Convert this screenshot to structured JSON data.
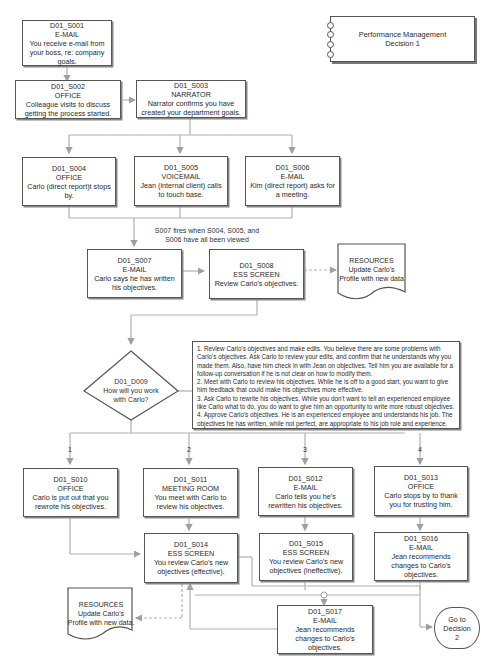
{
  "title_card": {
    "line1": "Performance Management",
    "line2": "Decision 1"
  },
  "nodes": {
    "s001": {
      "id": "D01_S001",
      "type": "E-MAIL",
      "text": "You receive e-mail from your boss, re: company goals."
    },
    "s002": {
      "id": "D01_S002",
      "type": "OFFICE",
      "text": "Colleague visits to discuss getting the process started."
    },
    "s003": {
      "id": "D01_S003",
      "type": "NARRATOR",
      "text": "Narrator confirms you have created your department goals."
    },
    "s004": {
      "id": "D01_S004",
      "type": "OFFICE",
      "text": "Carlo (direct report)t stops by."
    },
    "s005": {
      "id": "D01_S005",
      "type": "VOICEMAIL",
      "text": "Jean (internal client) calls to touch base."
    },
    "s006": {
      "id": "D01_S006",
      "type": "E-MAIL",
      "text": "Kim (direct report) asks for a meeting."
    },
    "s007": {
      "id": "D01_S007",
      "type": "E-MAIL",
      "text": "Carlo says he has written his objectives."
    },
    "s008": {
      "id": "D01_S008",
      "type": "ESS SCREEN",
      "text": "Review Carlo's objectives."
    },
    "s010": {
      "id": "D01_S010",
      "type": "OFFICE",
      "text": "Carlo is put out that you rewrote his objectives."
    },
    "s011": {
      "id": "D01_S011",
      "type": "MEETING ROOM",
      "text": "You meet with Carlo to review his objectives."
    },
    "s012": {
      "id": "D01_S012",
      "type": "E-MAIL",
      "text": "Carlo tells you he's rewritten his objectives."
    },
    "s013": {
      "id": "D01_S013",
      "type": "OFFICE",
      "text": "Carlo stops by to thank you for trusting him."
    },
    "s014": {
      "id": "D01_S014",
      "type": "ESS SCREEN",
      "text": "You review Carlo's new objectives (effective)."
    },
    "s015": {
      "id": "D01_S015",
      "type": "ESS SCREEN",
      "text": "You review Carlo's new objectives (ineffective)."
    },
    "s016": {
      "id": "D01_S016",
      "type": "E-MAIL",
      "text": "Jean recommends changes to Carlo's objectives."
    },
    "s017": {
      "id": "D01_S017",
      "type": "E-MAIL",
      "text": "Jean recommends changes to Carlo's objectives."
    }
  },
  "decision": {
    "id": "D01_D009",
    "question": "How will you work with Carlo?"
  },
  "fire_note": {
    "line1": "S007 fires when S004, S005, and",
    "line2": "S006 have all been viewed"
  },
  "resources_top": {
    "title": "RESOURCES",
    "line1": "Update Carlo's",
    "line2": "Profile with new data"
  },
  "resources_bottom": {
    "title": "RESOURCES",
    "line1": "Update Carlo's",
    "line2": "Profile with new data."
  },
  "options_note": "1. Review Carlo's objectives and make edits. You believe there are some problems with Carlo's objectives. Ask Carlo to review your edits, and confirm that he understands why you made them. Also, have him check in with Jean on objectives. Tell him you are available for a follow-up conversation if he is not clear on how to modify them.\n2. Meet with Carlo to review his objectives. While he is off to a good start, you want to give him feedback that could make his objectives more effective.\n3. Ask Carlo to rewrite his objectives. While you don't want to tell an experienced employee like Carlo what to do, you do want to give him an opportunity to write more robust objectives.\n4. Approve Carlo's objectives. He is an experienced employee and understands his job. The objectives he has written, while not perfect, are appropriate to his job role and experience.",
  "branch_labels": [
    "1",
    "2",
    "3",
    "4"
  ],
  "terminal": {
    "line1": "Go to Decision",
    "line2": "2"
  },
  "colors": {
    "line": "#a8a8a8",
    "border": "#555555",
    "text": "#2a2a2a"
  }
}
